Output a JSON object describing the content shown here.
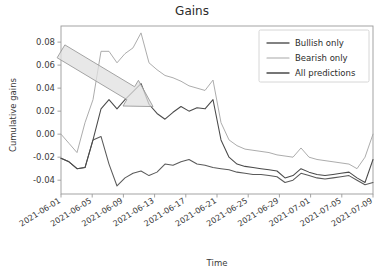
{
  "chart_data": {
    "type": "line",
    "title": "Gains",
    "xlabel": "Time",
    "ylabel": "Cumulative gains",
    "grid": false,
    "legend_position": "upper right",
    "ylim": [
      -0.052,
      0.094
    ],
    "yticks": [
      0.08,
      0.06,
      0.04,
      0.02,
      0.0,
      -0.02,
      -0.04
    ],
    "ytick_labels": [
      "0.08",
      "0.06",
      "0.04",
      "0.02",
      "0.00",
      "-0.02",
      "-0.04"
    ],
    "xtick_labels": [
      "2021-06-01",
      "2021-06-05",
      "2021-06-09",
      "2021-06-13",
      "2021-06-17",
      "2021-06-21",
      "2021-06-25",
      "2021-06-29",
      "2021-07-01",
      "2021-07-05",
      "2021-07-09"
    ],
    "x": [
      0,
      1,
      2,
      3,
      4,
      5,
      6,
      7,
      8,
      9,
      10,
      11,
      12,
      13,
      14,
      15,
      16,
      17,
      18,
      19,
      20,
      21,
      22,
      23,
      24,
      25,
      26,
      27,
      28,
      29,
      30,
      31,
      32,
      33,
      34,
      35,
      36,
      37,
      38,
      39
    ],
    "series": [
      {
        "name": "Bullish only",
        "color": "#5a5a5a",
        "values": [
          -0.021,
          -0.024,
          -0.03,
          -0.029,
          -0.005,
          -0.002,
          -0.026,
          -0.045,
          -0.038,
          -0.034,
          -0.032,
          -0.036,
          -0.033,
          -0.026,
          -0.027,
          -0.024,
          -0.022,
          -0.026,
          -0.027,
          -0.029,
          -0.03,
          -0.031,
          -0.033,
          -0.034,
          -0.035,
          -0.035,
          -0.036,
          -0.037,
          -0.042,
          -0.04,
          -0.034,
          -0.036,
          -0.038,
          -0.039,
          -0.038,
          -0.037,
          -0.036,
          -0.04,
          -0.044,
          -0.042
        ]
      },
      {
        "name": "Bearish only",
        "color": "#a8a8a8",
        "values": [
          0.0,
          -0.008,
          -0.016,
          0.01,
          0.03,
          0.072,
          0.072,
          0.062,
          0.07,
          0.075,
          0.088,
          0.062,
          0.056,
          0.051,
          0.049,
          0.046,
          0.042,
          0.04,
          0.038,
          0.047,
          0.01,
          -0.005,
          -0.01,
          -0.013,
          -0.014,
          -0.015,
          -0.016,
          -0.018,
          -0.019,
          -0.02,
          -0.012,
          -0.02,
          -0.022,
          -0.023,
          -0.024,
          -0.025,
          -0.026,
          -0.03,
          -0.02,
          0.0
        ]
      },
      {
        "name": "All predictions",
        "color": "#4a4a4a",
        "values": [
          -0.021,
          -0.024,
          -0.03,
          -0.029,
          -0.005,
          0.022,
          0.03,
          0.022,
          0.03,
          0.037,
          0.044,
          0.026,
          0.018,
          0.013,
          0.019,
          0.024,
          0.02,
          0.023,
          0.022,
          0.03,
          -0.005,
          -0.02,
          -0.026,
          -0.028,
          -0.029,
          -0.03,
          -0.031,
          -0.032,
          -0.038,
          -0.036,
          -0.03,
          -0.033,
          -0.035,
          -0.036,
          -0.035,
          -0.034,
          -0.033,
          -0.038,
          -0.042,
          -0.022
        ]
      }
    ],
    "annotations": [
      {
        "name": "trend-arrow",
        "type": "arrow",
        "fill": "#e0e0e0",
        "stroke": "#9a9a9a",
        "from": [
          0.0,
          0.072
        ],
        "to": [
          11.5,
          0.024
        ]
      }
    ]
  }
}
